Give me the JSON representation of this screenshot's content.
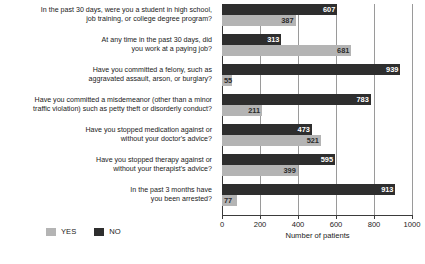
{
  "chart_data": {
    "type": "bar",
    "orientation": "horizontal",
    "title": "",
    "xlabel": "Number of patients",
    "ylabel": "",
    "xlim": [
      0,
      1000
    ],
    "xticks": [
      "0",
      "200",
      "400",
      "600",
      "800",
      "1000"
    ],
    "grid": true,
    "legend_position": "bottom-left",
    "categories": [
      "In the past 30 days, were you a student in high school, job training, or college degree program?",
      "At any time in the past 30 days, did you work at a paying job?",
      "Have you committed a felony, such as aggravated assault, arson, or burglary?",
      "Have you committed a misdemeanor (other than a minor traffic violation) such as petty theft or disorderly conduct?",
      "Have you stopped medication against or without your doctor's advice?",
      "Have you stopped therapy against or without your therapist's advice?",
      "In the past 3 months have you been arrested?"
    ],
    "category_lines": [
      [
        "In the past 30 days, were you a student in high school,",
        "job training, or college degree program?"
      ],
      [
        "At any time in the past 30 days, did",
        "you work at a paying job?"
      ],
      [
        "Have you committed a felony, such as",
        "aggravated assault, arson, or burglary?"
      ],
      [
        "Have you committed a misdemeanor (other than a minor",
        "traffic violation) such as petty theft or disorderly conduct?"
      ],
      [
        "Have you stopped medication against or",
        "without your doctor's advice?"
      ],
      [
        "Have you stopped therapy against or",
        "without your therapist's advice?"
      ],
      [
        "In the past 3 months have",
        "you been arrested?"
      ]
    ],
    "series": [
      {
        "name": "NO",
        "color": "#2e2e2e",
        "values": [
          607,
          313,
          939,
          783,
          473,
          595,
          913
        ]
      },
      {
        "name": "YES",
        "color": "#b4b4b4",
        "values": [
          387,
          681,
          55,
          211,
          521,
          399,
          77
        ]
      }
    ]
  },
  "legend": {
    "items": [
      {
        "label": "YES",
        "swatch": "yes"
      },
      {
        "label": "NO",
        "swatch": "no"
      }
    ]
  },
  "footnote": {
    "text": ""
  }
}
